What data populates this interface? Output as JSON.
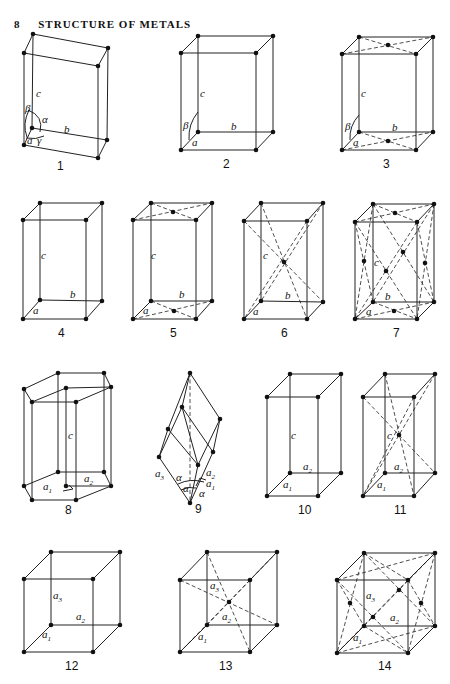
{
  "header": {
    "page_number": "8",
    "title": "STRUCTURE OF METALS"
  },
  "figures": [
    {
      "number": "1",
      "labels": {
        "c": "c",
        "b": "b",
        "a": "a",
        "alpha": "α",
        "beta": "β",
        "gamma": "γ"
      }
    },
    {
      "number": "2",
      "labels": {
        "c": "c",
        "b": "b",
        "a": "a",
        "beta": "β"
      }
    },
    {
      "number": "3",
      "labels": {
        "c": "c",
        "b": "b",
        "a": "a",
        "beta": "β"
      }
    },
    {
      "number": "4",
      "labels": {
        "c": "c",
        "b": "b",
        "a": "a"
      }
    },
    {
      "number": "5",
      "labels": {
        "c": "c",
        "b": "b",
        "a": "a"
      }
    },
    {
      "number": "6",
      "labels": {
        "c": "c",
        "b": "b",
        "a": "a"
      }
    },
    {
      "number": "7",
      "labels": {
        "c": "c",
        "b": "b",
        "a": "a"
      }
    },
    {
      "number": "8",
      "labels": {
        "c": "c",
        "a1": "a",
        "a2": "a",
        "s1": "1",
        "s2": "2"
      }
    },
    {
      "number": "9",
      "labels": {
        "a1": "a",
        "a2": "a",
        "a3": "a",
        "s1": "1",
        "s2": "2",
        "s3": "3",
        "alpha": "α"
      }
    },
    {
      "number": "10",
      "labels": {
        "c": "c",
        "a1": "a",
        "a2": "a",
        "s1": "1",
        "s2": "2"
      }
    },
    {
      "number": "11",
      "labels": {
        "c": "c",
        "a1": "a",
        "a2": "a",
        "s1": "1",
        "s2": "2"
      }
    },
    {
      "number": "12",
      "labels": {
        "a1": "a",
        "a2": "a",
        "a3": "a",
        "s1": "1",
        "s2": "2",
        "s3": "3"
      }
    },
    {
      "number": "13",
      "labels": {
        "a1": "a",
        "a2": "a",
        "a3": "a",
        "s1": "1",
        "s2": "2",
        "s3": "3"
      }
    },
    {
      "number": "14",
      "labels": {
        "a1": "a",
        "a2": "a",
        "a3": "a",
        "s1": "1",
        "s2": "2",
        "s3": "3"
      }
    }
  ]
}
